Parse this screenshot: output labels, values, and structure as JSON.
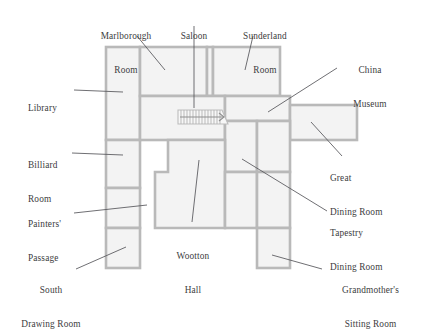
{
  "diagram": {
    "type": "floor-plan",
    "colors": {
      "room_fill": "#f3f3f3",
      "wall_stroke": "#b9b9b9",
      "leader_line": "#55555a",
      "label_text": "#3c3c40",
      "background": "#ffffff"
    },
    "stair": {
      "name": "staircase",
      "direction_marker": "arrow-right",
      "tread_count": 14
    },
    "labels": [
      {
        "id": "marlborough-room",
        "text": "Marlborough\nRoom",
        "line1": "Marlborough",
        "line2": "Room",
        "align": "center",
        "x": 79,
        "y": 8,
        "w": 94,
        "leader": {
          "x1": 137,
          "y1": 36,
          "x2": 165,
          "y2": 70
        }
      },
      {
        "id": "saloon",
        "text": "Saloon",
        "line1": "Saloon",
        "line2": "",
        "align": "center",
        "x": 160,
        "y": 8,
        "w": 68,
        "leader": {
          "x1": 194,
          "y1": 24,
          "x2": 194,
          "y2": 108
        }
      },
      {
        "id": "sunderland-room",
        "text": "Sunderland\nRoom",
        "line1": "Sunderland",
        "line2": "Room",
        "align": "center",
        "x": 222,
        "y": 8,
        "w": 86,
        "leader": {
          "x1": 253,
          "y1": 36,
          "x2": 245,
          "y2": 70
        }
      },
      {
        "id": "china-museum",
        "text": "China\nMuseum",
        "line1": "China",
        "line2": "Museum",
        "align": "center",
        "x": 330,
        "y": 42,
        "w": 80,
        "leader": {
          "x1": 337,
          "y1": 68,
          "x2": 268,
          "y2": 112
        }
      },
      {
        "id": "library",
        "text": "Library",
        "line1": "Library",
        "line2": "",
        "align": "left",
        "x": 26,
        "y": 80,
        "w": 60,
        "leader": {
          "x1": 74,
          "y1": 90,
          "x2": 123,
          "y2": 92
        }
      },
      {
        "id": "great-dining-room",
        "text": "Great\nDining Room",
        "line1": "Great",
        "line2": "Dining Room",
        "align": "left",
        "x": 330,
        "y": 150,
        "w": 90,
        "leader": {
          "x1": 342,
          "y1": 154,
          "x2": 311,
          "y2": 122
        }
      },
      {
        "id": "billiard-room",
        "text": "Billiard\nRoom",
        "line1": "Billiard",
        "line2": "Room",
        "align": "left",
        "x": 26,
        "y": 137,
        "w": 66,
        "leader": {
          "x1": 72,
          "y1": 153,
          "x2": 123,
          "y2": 154
        }
      },
      {
        "id": "painters-passage",
        "text": "Painters'\nPassage",
        "line1": "Painters'",
        "line2": "Passage",
        "align": "left",
        "x": 26,
        "y": 196,
        "w": 70,
        "leader": {
          "x1": 74,
          "y1": 212,
          "x2": 147,
          "y2": 204
        }
      },
      {
        "id": "tapestry-dining-room",
        "text": "Tapestry\nDining Room",
        "line1": "Tapestry",
        "line2": "Dining Room",
        "align": "left",
        "x": 330,
        "y": 205,
        "w": 90,
        "leader": {
          "x1": 327,
          "y1": 210,
          "x2": 242,
          "y2": 159
        }
      },
      {
        "id": "wootton-hall",
        "text": "Wootton\nHall",
        "line1": "Wootton",
        "line2": "Hall",
        "align": "center",
        "x": 155,
        "y": 228,
        "w": 76,
        "leader": {
          "x1": 192,
          "y1": 222,
          "x2": 199,
          "y2": 160
        }
      },
      {
        "id": "south-drawing-room",
        "text": "South\nDrawing Room",
        "line1": "South",
        "line2": "Drawing Room",
        "align": "center",
        "x": 4,
        "y": 262,
        "w": 96,
        "leader": {
          "x1": 76,
          "y1": 268,
          "x2": 126,
          "y2": 246
        }
      },
      {
        "id": "grandmothers-sitting-room",
        "text": "Grandmother's\nSitting Room",
        "line1": "Grandmother's",
        "line2": "Sitting Room",
        "align": "center",
        "x": 320,
        "y": 262,
        "w": 100,
        "leader": {
          "x1": 322,
          "y1": 268,
          "x2": 272,
          "y2": 254
        }
      }
    ],
    "rooms": [
      {
        "id": "library-block",
        "points": "106,47 140,47 140,140 106,140"
      },
      {
        "id": "marlborough-block",
        "points": "140,47 207,47 207,96 140,96"
      },
      {
        "id": "saloon-strip",
        "points": "207,47 212,47 212,96 207,96"
      },
      {
        "id": "sunderland-block",
        "points": "212,47 280,47 280,96 212,96"
      },
      {
        "id": "central-hall-block",
        "points": "140,96 225,96 225,140 140,140"
      },
      {
        "id": "china-museum-block",
        "points": "225,96 280,96 280,121 225,121"
      },
      {
        "id": "great-dining-block",
        "points": "290,105 357,105 357,140 290,140"
      },
      {
        "id": "upper-right-link",
        "points": "280,96 290,96 290,140 280,140"
      },
      {
        "id": "billiard-block",
        "points": "106,140 140,140 140,188 106,188"
      },
      {
        "id": "tapestry-block",
        "points": "225,121 257,121 257,172 225,172"
      },
      {
        "id": "tapestry-east-block",
        "points": "257,121 290,121 290,172 257,172"
      },
      {
        "id": "wootton-upper",
        "points": "168,140 225,140 225,172 168,172"
      },
      {
        "id": "wootton-lower",
        "points": "155,172 225,172 225,228 155,228"
      },
      {
        "id": "painters-block",
        "points": "106,188 140,188 140,228 106,228"
      },
      {
        "id": "south-drawing-block",
        "points": "106,228 140,228 140,268 106,268"
      },
      {
        "id": "lower-center-right",
        "points": "225,172 257,172 257,228 225,228"
      },
      {
        "id": "lower-right-block",
        "points": "257,172 290,172 290,228 257,228"
      },
      {
        "id": "grandmother-block",
        "points": "257,228 290,228 290,268 257,268"
      }
    ]
  }
}
